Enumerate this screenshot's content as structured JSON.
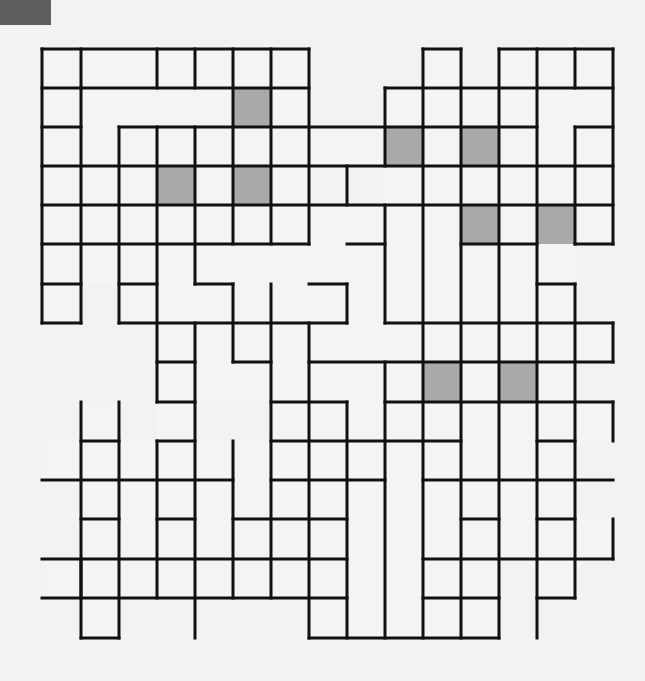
{
  "puzzle": {
    "type": "crossword-fill-in grid",
    "columns": 15,
    "rows": 15,
    "x_lines": [
      42,
      81,
      119,
      157,
      195,
      233,
      271,
      309,
      347,
      385,
      423,
      461,
      499,
      537,
      575,
      613
    ],
    "y_lines": [
      49,
      88,
      127,
      166,
      205,
      244,
      284,
      323,
      362,
      402,
      441,
      480,
      519,
      559,
      598,
      638
    ],
    "colors": {
      "background": "#f2f2f0",
      "cell": "#f4f4f2",
      "shaded": "#a9a9a9",
      "line": "#111111",
      "corner_tab": "#5e5e5e"
    },
    "shaded_cells": [
      [
        1,
        5
      ],
      [
        2,
        9
      ],
      [
        2,
        11
      ],
      [
        3,
        3
      ],
      [
        3,
        5
      ],
      [
        4,
        11
      ],
      [
        4,
        13
      ],
      [
        8,
        10
      ],
      [
        8,
        12
      ]
    ],
    "cells": [
      [
        0,
        0
      ],
      [
        0,
        1
      ],
      [
        0,
        2
      ],
      [
        0,
        3
      ],
      [
        0,
        4
      ],
      [
        0,
        5
      ],
      [
        0,
        6
      ],
      [
        0,
        10
      ],
      [
        0,
        12
      ],
      [
        0,
        13
      ],
      [
        0,
        14
      ],
      [
        1,
        0
      ],
      [
        1,
        1
      ],
      [
        1,
        2
      ],
      [
        1,
        3
      ],
      [
        1,
        4
      ],
      [
        1,
        5
      ],
      [
        1,
        6
      ],
      [
        1,
        9
      ],
      [
        1,
        10
      ],
      [
        1,
        11
      ],
      [
        1,
        12
      ],
      [
        1,
        13
      ],
      [
        1,
        14
      ],
      [
        2,
        0
      ],
      [
        2,
        1
      ],
      [
        2,
        2
      ],
      [
        2,
        3
      ],
      [
        2,
        4
      ],
      [
        2,
        5
      ],
      [
        2,
        6
      ],
      [
        2,
        7
      ],
      [
        2,
        8
      ],
      [
        2,
        9
      ],
      [
        2,
        10
      ],
      [
        2,
        11
      ],
      [
        2,
        12
      ],
      [
        2,
        13
      ],
      [
        2,
        14
      ],
      [
        3,
        0
      ],
      [
        3,
        1
      ],
      [
        3,
        2
      ],
      [
        3,
        3
      ],
      [
        3,
        4
      ],
      [
        3,
        5
      ],
      [
        3,
        6
      ],
      [
        3,
        9
      ],
      [
        3,
        10
      ],
      [
        3,
        11
      ],
      [
        3,
        12
      ],
      [
        3,
        13
      ],
      [
        3,
        14
      ],
      [
        4,
        0
      ],
      [
        4,
        1
      ],
      [
        4,
        2
      ],
      [
        4,
        3
      ],
      [
        4,
        4
      ],
      [
        4,
        5
      ],
      [
        4,
        6
      ],
      [
        4,
        7
      ],
      [
        4,
        8
      ],
      [
        4,
        9
      ],
      [
        4,
        10
      ],
      [
        4,
        11
      ],
      [
        4,
        12
      ],
      [
        4,
        13
      ],
      [
        4,
        14
      ],
      [
        5,
        0
      ],
      [
        5,
        1
      ],
      [
        5,
        2
      ],
      [
        5,
        3
      ],
      [
        5,
        4
      ],
      [
        5,
        5
      ],
      [
        5,
        6
      ],
      [
        5,
        7
      ],
      [
        5,
        8
      ],
      [
        5,
        9
      ],
      [
        5,
        10
      ],
      [
        5,
        11
      ],
      [
        5,
        12
      ],
      [
        5,
        13
      ],
      [
        6,
        0
      ],
      [
        6,
        2
      ],
      [
        6,
        3
      ],
      [
        6,
        4
      ],
      [
        6,
        5
      ],
      [
        6,
        6
      ],
      [
        6,
        7
      ],
      [
        6,
        8
      ],
      [
        6,
        9
      ],
      [
        6,
        10
      ],
      [
        6,
        11
      ],
      [
        6,
        12
      ],
      [
        6,
        13
      ],
      [
        7,
        3
      ],
      [
        7,
        4
      ],
      [
        7,
        5
      ],
      [
        7,
        6
      ],
      [
        7,
        7
      ],
      [
        7,
        8
      ],
      [
        7,
        9
      ],
      [
        7,
        10
      ],
      [
        7,
        11
      ],
      [
        7,
        12
      ],
      [
        7,
        13
      ],
      [
        7,
        14
      ],
      [
        8,
        3
      ],
      [
        8,
        4
      ],
      [
        8,
        5
      ],
      [
        8,
        6
      ],
      [
        8,
        7
      ],
      [
        8,
        8
      ],
      [
        8,
        9
      ],
      [
        8,
        10
      ],
      [
        8,
        11
      ],
      [
        8,
        12
      ],
      [
        8,
        13
      ],
      [
        9,
        1
      ],
      [
        9,
        3
      ],
      [
        9,
        6
      ],
      [
        9,
        7
      ],
      [
        9,
        8
      ],
      [
        9,
        9
      ],
      [
        9,
        10
      ],
      [
        9,
        11
      ],
      [
        9,
        12
      ],
      [
        9,
        13
      ],
      [
        9,
        14
      ],
      [
        10,
        0
      ],
      [
        10,
        1
      ],
      [
        10,
        2
      ],
      [
        10,
        3
      ],
      [
        10,
        4
      ],
      [
        10,
        5
      ],
      [
        10,
        6
      ],
      [
        10,
        7
      ],
      [
        10,
        8
      ],
      [
        10,
        9
      ],
      [
        10,
        10
      ],
      [
        10,
        11
      ],
      [
        10,
        12
      ],
      [
        10,
        13
      ],
      [
        11,
        1
      ],
      [
        11,
        2
      ],
      [
        11,
        3
      ],
      [
        11,
        4
      ],
      [
        11,
        5
      ],
      [
        11,
        6
      ],
      [
        11,
        7
      ],
      [
        11,
        8
      ],
      [
        11,
        9
      ],
      [
        11,
        10
      ],
      [
        11,
        11
      ],
      [
        11,
        12
      ],
      [
        11,
        13
      ],
      [
        12,
        1
      ],
      [
        12,
        2
      ],
      [
        12,
        3
      ],
      [
        12,
        4
      ],
      [
        12,
        5
      ],
      [
        12,
        6
      ],
      [
        12,
        7
      ],
      [
        12,
        8
      ],
      [
        12,
        9
      ],
      [
        12,
        10
      ],
      [
        12,
        11
      ],
      [
        12,
        12
      ],
      [
        12,
        13
      ],
      [
        12,
        14
      ],
      [
        13,
        0
      ],
      [
        13,
        1
      ],
      [
        13,
        2
      ],
      [
        13,
        3
      ],
      [
        13,
        4
      ],
      [
        13,
        5
      ],
      [
        13,
        6
      ],
      [
        13,
        7
      ],
      [
        13,
        8
      ],
      [
        13,
        9
      ],
      [
        13,
        10
      ],
      [
        13,
        11
      ],
      [
        13,
        13
      ],
      [
        14,
        1
      ],
      [
        14,
        7
      ],
      [
        14,
        8
      ],
      [
        14,
        9
      ],
      [
        14,
        10
      ],
      [
        14,
        11
      ]
    ],
    "h_segments": [
      [
        0,
        0,
        7
      ],
      [
        0,
        10,
        11
      ],
      [
        0,
        12,
        15
      ],
      [
        1,
        0,
        7
      ],
      [
        1,
        9,
        15
      ],
      [
        2,
        0,
        1
      ],
      [
        2,
        2,
        13
      ],
      [
        2,
        14,
        15
      ],
      [
        3,
        0,
        15
      ],
      [
        4,
        0,
        15
      ],
      [
        5,
        0,
        7
      ],
      [
        5,
        8,
        9
      ],
      [
        5,
        11,
        13
      ],
      [
        5,
        14,
        15
      ],
      [
        6,
        0,
        1
      ],
      [
        6,
        2,
        3
      ],
      [
        6,
        4,
        5
      ],
      [
        6,
        7,
        8
      ],
      [
        6,
        13,
        14
      ],
      [
        7,
        0,
        1
      ],
      [
        7,
        2,
        8
      ],
      [
        7,
        9,
        15
      ],
      [
        8,
        3,
        4
      ],
      [
        8,
        5,
        6
      ],
      [
        8,
        7,
        15
      ],
      [
        9,
        3,
        4
      ],
      [
        9,
        6,
        8
      ],
      [
        9,
        9,
        15
      ],
      [
        10,
        1,
        2
      ],
      [
        10,
        3,
        4
      ],
      [
        10,
        6,
        11
      ],
      [
        10,
        13,
        14
      ],
      [
        11,
        0,
        5
      ],
      [
        11,
        6,
        9
      ],
      [
        11,
        10,
        15
      ],
      [
        12,
        1,
        2
      ],
      [
        12,
        3,
        4
      ],
      [
        12,
        5,
        8
      ],
      [
        12,
        11,
        12
      ],
      [
        12,
        13,
        14
      ],
      [
        13,
        0,
        8
      ],
      [
        13,
        10,
        15
      ],
      [
        14,
        0,
        8
      ],
      [
        14,
        10,
        12
      ],
      [
        14,
        13,
        14
      ],
      [
        15,
        1,
        2
      ],
      [
        15,
        7,
        12
      ]
    ],
    "v_segments": [
      [
        0,
        0,
        7
      ],
      [
        1,
        0,
        1
      ],
      [
        1,
        1,
        7
      ],
      [
        1,
        9,
        14
      ],
      [
        1,
        13,
        15
      ],
      [
        2,
        2,
        7
      ],
      [
        2,
        9,
        15
      ],
      [
        3,
        0,
        1
      ],
      [
        3,
        2,
        9
      ],
      [
        3,
        10,
        14
      ],
      [
        4,
        0,
        1
      ],
      [
        4,
        2,
        6
      ],
      [
        4,
        7,
        15
      ],
      [
        5,
        0,
        5
      ],
      [
        5,
        6,
        8
      ],
      [
        5,
        10,
        14
      ],
      [
        6,
        0,
        5
      ],
      [
        6,
        6,
        14
      ],
      [
        7,
        0,
        5
      ],
      [
        7,
        7,
        15
      ],
      [
        8,
        3,
        4
      ],
      [
        8,
        6,
        7
      ],
      [
        8,
        9,
        15
      ],
      [
        9,
        1,
        3
      ],
      [
        9,
        4,
        7
      ],
      [
        9,
        8,
        15
      ],
      [
        10,
        0,
        15
      ],
      [
        11,
        0,
        1
      ],
      [
        11,
        1,
        15
      ],
      [
        12,
        0,
        15
      ],
      [
        13,
        0,
        15
      ],
      [
        14,
        0,
        1
      ],
      [
        14,
        2,
        5
      ],
      [
        14,
        6,
        14
      ],
      [
        15,
        0,
        5
      ],
      [
        15,
        7,
        8
      ],
      [
        15,
        9,
        10
      ],
      [
        15,
        12,
        13
      ]
    ]
  }
}
